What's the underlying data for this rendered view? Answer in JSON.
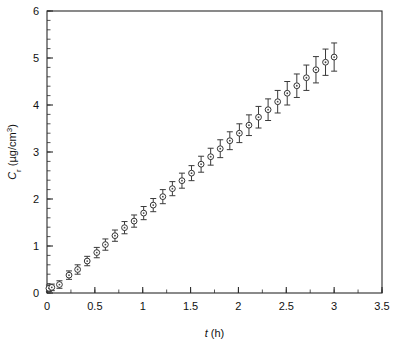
{
  "figure": {
    "name": "drug-permeation-cumulative-amount-plot",
    "background": "#ffffff",
    "ink_color": "#333333"
  },
  "chart_data": {
    "type": "scatter",
    "title": "",
    "subtitle": "",
    "xlabel": "t (h)",
    "xlabel_symbol": "t",
    "xlabel_units": "(h)",
    "ylabel": "C_r (µg/cm³)",
    "ylabel_symbol": "C",
    "ylabel_subscript": "r",
    "ylabel_units": "(µg/cm³)",
    "xlim": [
      0,
      3.5
    ],
    "ylim": [
      0,
      6
    ],
    "x_major_ticks": [
      0,
      0.5,
      1,
      1.5,
      2,
      2.5,
      3,
      3.5
    ],
    "x_major_tick_labels": [
      "0",
      "0.5",
      "1",
      "1.5",
      "2",
      "2.5",
      "3",
      "3.5"
    ],
    "x_minor_step": 0.25,
    "y_major_ticks": [
      0,
      1,
      2,
      3,
      4,
      5,
      6
    ],
    "y_major_tick_labels": [
      "0",
      "1",
      "2",
      "3",
      "4",
      "5",
      "6"
    ],
    "y_minor_step": 0.2,
    "grid": false,
    "legend": null,
    "legend_position": "none",
    "marker": "open-circle-with-center-dot",
    "error_bars": "symmetric-vertical-with-caps",
    "series": [
      {
        "name": "Cr",
        "x": [
          0.02,
          0.05,
          0.13,
          0.23,
          0.32,
          0.42,
          0.52,
          0.61,
          0.71,
          0.81,
          0.91,
          1.01,
          1.11,
          1.21,
          1.31,
          1.41,
          1.51,
          1.61,
          1.71,
          1.81,
          1.91,
          2.01,
          2.11,
          2.21,
          2.31,
          2.41,
          2.51,
          2.61,
          2.71,
          2.81,
          2.91,
          3.0
        ],
        "y": [
          0.1,
          0.12,
          0.18,
          0.38,
          0.5,
          0.68,
          0.86,
          1.03,
          1.22,
          1.39,
          1.53,
          1.7,
          1.87,
          2.05,
          2.22,
          2.39,
          2.55,
          2.74,
          2.9,
          3.07,
          3.24,
          3.4,
          3.57,
          3.74,
          3.9,
          4.07,
          4.25,
          4.41,
          4.58,
          4.75,
          4.91,
          5.02
        ],
        "yerr": [
          0.07,
          0.07,
          0.08,
          0.09,
          0.1,
          0.1,
          0.11,
          0.12,
          0.12,
          0.13,
          0.13,
          0.14,
          0.14,
          0.15,
          0.15,
          0.16,
          0.16,
          0.17,
          0.18,
          0.19,
          0.19,
          0.2,
          0.22,
          0.23,
          0.23,
          0.24,
          0.25,
          0.25,
          0.27,
          0.28,
          0.28,
          0.3
        ]
      }
    ]
  }
}
